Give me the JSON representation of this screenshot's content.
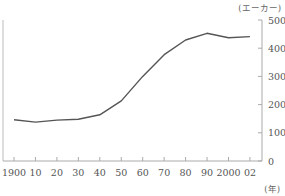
{
  "chart_data": {
    "type": "line",
    "title": "",
    "xlabel": "(年)",
    "ylabel": "(エーカー)",
    "x": [
      1900,
      1910,
      1920,
      1930,
      1940,
      1950,
      1960,
      1970,
      1980,
      1990,
      2000,
      2002
    ],
    "x_tick_labels": [
      "1900",
      "10",
      "20",
      "30",
      "40",
      "50",
      "60",
      "70",
      "80",
      "90",
      "2000",
      "02"
    ],
    "series": [
      {
        "name": "farm size",
        "values": [
          146,
          138,
          145,
          148,
          164,
          213,
          300,
          377,
          429,
          453,
          437,
          441
        ],
        "color": "#555555"
      }
    ],
    "y_ticks": [
      0,
      100,
      200,
      300,
      400,
      500
    ],
    "y_tick_labels": [
      "0",
      "100",
      "200",
      "300",
      "400",
      "500"
    ],
    "ylim": [
      0,
      500
    ],
    "y_axis_position": "right",
    "grid": false,
    "legend": "none"
  },
  "labels": {
    "y_unit": "(エーカー)",
    "x_unit": "(年)"
  }
}
